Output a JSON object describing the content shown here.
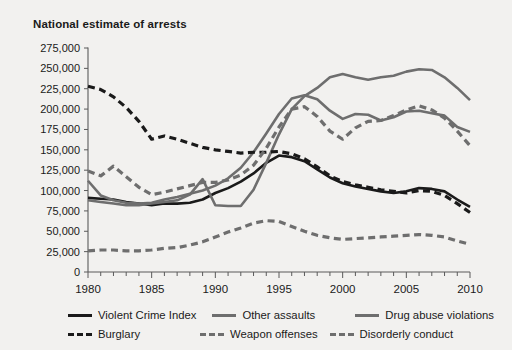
{
  "title": "National estimate of arrests",
  "chart_data": {
    "type": "line",
    "title": "National estimate of arrests",
    "xlabel": "",
    "ylabel": "",
    "xlim": [
      1980,
      2010
    ],
    "ylim": [
      0,
      275000
    ],
    "ytick_labels": [
      "0",
      "25,000",
      "50,000",
      "75,000",
      "100,000",
      "125,000",
      "150,000",
      "175,000",
      "200,000",
      "225,000",
      "250,000",
      "275,000"
    ],
    "ytick_values": [
      0,
      25000,
      50000,
      75000,
      100000,
      125000,
      150000,
      175000,
      200000,
      225000,
      250000,
      275000
    ],
    "xtick_labels": [
      "1980",
      "1985",
      "1990",
      "1995",
      "2000",
      "2005",
      "2010"
    ],
    "xtick_values": [
      1980,
      1985,
      1990,
      1995,
      2000,
      2005,
      2010
    ],
    "minor_xticks_every": 1,
    "grid": false,
    "legend_position": "below",
    "x": [
      1980,
      1981,
      1982,
      1983,
      1984,
      1985,
      1986,
      1987,
      1988,
      1989,
      1990,
      1991,
      1992,
      1993,
      1994,
      1995,
      1996,
      1997,
      1998,
      1999,
      2000,
      2001,
      2002,
      2003,
      2004,
      2005,
      2006,
      2007,
      2008,
      2009,
      2010
    ],
    "series": [
      {
        "name": "Violent Crime Index",
        "color": "#1a1a1a",
        "style": "solid",
        "width": 2.6,
        "values": [
          91000,
          90000,
          89000,
          86000,
          84000,
          82000,
          84000,
          84000,
          85000,
          89000,
          97000,
          103000,
          111000,
          121000,
          134000,
          143000,
          141000,
          136000,
          126000,
          116000,
          109000,
          105000,
          102000,
          99000,
          97000,
          99000,
          103000,
          102000,
          99000,
          89000,
          80000
        ]
      },
      {
        "name": "Other assaults",
        "color": "#6e6e6e",
        "style": "solid",
        "width": 2.6,
        "values": [
          112000,
          94000,
          88000,
          85000,
          84000,
          85000,
          89000,
          92000,
          96000,
          100000,
          106000,
          115000,
          128000,
          147000,
          170000,
          194000,
          213000,
          217000,
          212000,
          198000,
          188000,
          194000,
          193000,
          186000,
          190000,
          197000,
          198000,
          195000,
          192000,
          178000,
          172000
        ]
      },
      {
        "name": "Drug abuse violations",
        "color": "#6e6e6e",
        "style": "solid",
        "width": 2.6,
        "values": [
          88000,
          86000,
          84000,
          82000,
          82000,
          84000,
          86000,
          88000,
          95000,
          114000,
          82000,
          81000,
          81000,
          101000,
          134000,
          169000,
          200000,
          216000,
          226000,
          239000,
          243000,
          239000,
          236000,
          239000,
          241000,
          246000,
          249000,
          248000,
          239000,
          226000,
          211000
        ]
      },
      {
        "name": "Burglary",
        "color": "#1a1a1a",
        "style": "dashed",
        "width": 3.2,
        "values": [
          228000,
          224000,
          215000,
          202000,
          185000,
          163000,
          167000,
          163000,
          158000,
          153000,
          150000,
          148000,
          146000,
          147000,
          147000,
          148000,
          145000,
          139000,
          129000,
          118000,
          111000,
          107000,
          104000,
          101000,
          99000,
          97000,
          100000,
          99000,
          94000,
          84000,
          73000
        ]
      },
      {
        "name": "Weapon offenses",
        "color": "#6e6e6e",
        "style": "dashed",
        "width": 3.2,
        "values": [
          26000,
          27000,
          27000,
          26000,
          26000,
          27000,
          29000,
          30000,
          33000,
          37000,
          43000,
          49000,
          54000,
          60000,
          63000,
          62000,
          56000,
          50000,
          45000,
          42000,
          40000,
          41000,
          42000,
          43000,
          44000,
          45000,
          46000,
          45000,
          43000,
          38000,
          34000
        ]
      },
      {
        "name": "Disorderly conduct",
        "color": "#6e6e6e",
        "style": "dashed",
        "width": 3.2,
        "values": [
          124000,
          118000,
          130000,
          117000,
          104000,
          95000,
          98000,
          102000,
          106000,
          110000,
          110000,
          113000,
          119000,
          131000,
          152000,
          178000,
          200000,
          203000,
          191000,
          173000,
          163000,
          177000,
          185000,
          186000,
          192000,
          199000,
          204000,
          199000,
          189000,
          173000,
          155000
        ]
      }
    ]
  },
  "legend": {
    "row1": [
      {
        "label": "Violent Crime Index",
        "color": "#1a1a1a",
        "style": "solid"
      },
      {
        "label": "Other assaults",
        "color": "#6e6e6e",
        "style": "solid"
      },
      {
        "label": "Drug abuse violations",
        "color": "#6e6e6e",
        "style": "solid"
      }
    ],
    "row2": [
      {
        "label": "Burglary",
        "color": "#1a1a1a",
        "style": "dashed"
      },
      {
        "label": "Weapon offenses",
        "color": "#6e6e6e",
        "style": "dashed"
      },
      {
        "label": "Disorderly conduct",
        "color": "#6e6e6e",
        "style": "dashed"
      }
    ]
  },
  "colors": {
    "background": "#f2f1ef",
    "axis": "#5a5a5a",
    "text": "#1a1a1a",
    "dark_series": "#1a1a1a",
    "gray_series": "#6e6e6e"
  }
}
